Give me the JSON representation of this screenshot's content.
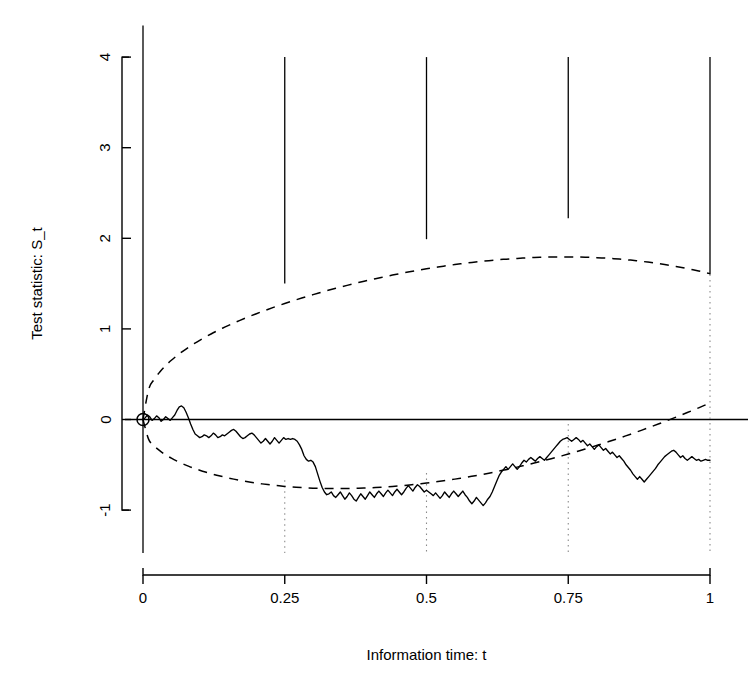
{
  "figure": {
    "background_color": "#ffffff",
    "ink_color": "#000000"
  },
  "chart_data": {
    "type": "line",
    "title": "",
    "subtitle": "",
    "xlabel": "Information time: t",
    "ylabel": "Test statistic: S_t",
    "xlim": [
      0,
      1
    ],
    "ylim": [
      -1.35,
      4.35
    ],
    "grid": false,
    "legend": null,
    "x_ticks": [
      0,
      0.25,
      0.5,
      0.75,
      1
    ],
    "x_tick_labels": [
      "0",
      "0.25",
      "0.5",
      "0.75",
      "1"
    ],
    "y_ticks": [
      -1,
      0,
      1,
      2,
      3,
      4
    ],
    "y_tick_labels": [
      "-1",
      "0",
      "1",
      "2",
      "3",
      "4"
    ],
    "series": [
      {
        "name": "Test statistic sample path",
        "style": "solid",
        "marker_at_origin": "open-circle",
        "x": [
          0,
          0.004,
          0.008,
          0.012,
          0.016,
          0.02,
          0.024,
          0.028,
          0.032,
          0.036,
          0.04,
          0.044,
          0.048,
          0.052,
          0.056,
          0.06,
          0.064,
          0.068,
          0.072,
          0.076,
          0.08,
          0.084,
          0.088,
          0.092,
          0.096,
          0.1,
          0.104,
          0.108,
          0.112,
          0.116,
          0.12,
          0.124,
          0.128,
          0.132,
          0.136,
          0.14,
          0.144,
          0.148,
          0.152,
          0.156,
          0.16,
          0.164,
          0.168,
          0.172,
          0.176,
          0.18,
          0.184,
          0.188,
          0.192,
          0.196,
          0.2,
          0.204,
          0.208,
          0.212,
          0.216,
          0.22,
          0.224,
          0.228,
          0.232,
          0.236,
          0.24,
          0.244,
          0.248,
          0.252,
          0.256,
          0.26,
          0.264,
          0.268,
          0.272,
          0.276,
          0.28,
          0.284,
          0.288,
          0.292,
          0.296,
          0.3,
          0.304,
          0.308,
          0.312,
          0.316,
          0.32,
          0.324,
          0.328,
          0.332,
          0.336,
          0.34,
          0.344,
          0.348,
          0.352,
          0.356,
          0.36,
          0.364,
          0.368,
          0.372,
          0.376,
          0.38,
          0.384,
          0.388,
          0.392,
          0.396,
          0.4,
          0.404,
          0.408,
          0.412,
          0.416,
          0.42,
          0.424,
          0.428,
          0.432,
          0.436,
          0.44,
          0.444,
          0.448,
          0.452,
          0.456,
          0.46,
          0.464,
          0.468,
          0.472,
          0.476,
          0.48,
          0.484,
          0.488,
          0.492,
          0.496,
          0.5,
          0.504,
          0.508,
          0.512,
          0.516,
          0.52,
          0.524,
          0.528,
          0.532,
          0.536,
          0.54,
          0.544,
          0.548,
          0.552,
          0.556,
          0.56,
          0.564,
          0.568,
          0.572,
          0.576,
          0.58,
          0.584,
          0.588,
          0.592,
          0.596,
          0.6,
          0.604,
          0.608,
          0.612,
          0.616,
          0.62,
          0.624,
          0.628,
          0.632,
          0.636,
          0.64,
          0.644,
          0.648,
          0.652,
          0.656,
          0.66,
          0.664,
          0.668,
          0.672,
          0.676,
          0.68,
          0.684,
          0.688,
          0.692,
          0.696,
          0.7,
          0.704,
          0.708,
          0.712,
          0.716,
          0.72,
          0.724,
          0.728,
          0.732,
          0.736,
          0.74,
          0.744,
          0.748,
          0.752,
          0.756,
          0.76,
          0.764,
          0.768,
          0.772,
          0.776,
          0.78,
          0.784,
          0.788,
          0.792,
          0.796,
          0.8,
          0.804,
          0.808,
          0.812,
          0.816,
          0.82,
          0.824,
          0.828,
          0.832,
          0.836,
          0.84,
          0.844,
          0.848,
          0.852,
          0.856,
          0.86,
          0.864,
          0.868,
          0.872,
          0.876,
          0.88,
          0.884,
          0.888,
          0.892,
          0.896,
          0.9,
          0.904,
          0.908,
          0.912,
          0.916,
          0.92,
          0.924,
          0.928,
          0.932,
          0.936,
          0.94,
          0.944,
          0.948,
          0.952,
          0.956,
          0.96,
          0.964,
          0.968,
          0.972,
          0.976,
          0.98,
          0.984,
          0.988,
          0.992,
          0.996,
          1
        ],
        "y": [
          0,
          0.02,
          0.05,
          0.03,
          -0.01,
          0.01,
          0.04,
          0.02,
          -0.02,
          0.0,
          0.03,
          0.01,
          -0.01,
          0.02,
          0.05,
          0.1,
          0.14,
          0.15,
          0.13,
          0.08,
          0.02,
          -0.05,
          -0.11,
          -0.16,
          -0.18,
          -0.2,
          -0.19,
          -0.17,
          -0.18,
          -0.2,
          -0.18,
          -0.15,
          -0.17,
          -0.2,
          -0.19,
          -0.17,
          -0.18,
          -0.16,
          -0.14,
          -0.12,
          -0.11,
          -0.13,
          -0.16,
          -0.19,
          -0.21,
          -0.2,
          -0.18,
          -0.16,
          -0.15,
          -0.17,
          -0.2,
          -0.23,
          -0.26,
          -0.24,
          -0.21,
          -0.24,
          -0.27,
          -0.24,
          -0.2,
          -0.23,
          -0.26,
          -0.23,
          -0.2,
          -0.22,
          -0.21,
          -0.22,
          -0.21,
          -0.22,
          -0.24,
          -0.28,
          -0.33,
          -0.4,
          -0.44,
          -0.46,
          -0.45,
          -0.47,
          -0.52,
          -0.6,
          -0.68,
          -0.75,
          -0.8,
          -0.83,
          -0.82,
          -0.8,
          -0.84,
          -0.86,
          -0.83,
          -0.8,
          -0.84,
          -0.88,
          -0.85,
          -0.81,
          -0.84,
          -0.88,
          -0.9,
          -0.86,
          -0.82,
          -0.85,
          -0.88,
          -0.84,
          -0.8,
          -0.83,
          -0.86,
          -0.82,
          -0.79,
          -0.82,
          -0.85,
          -0.81,
          -0.78,
          -0.81,
          -0.84,
          -0.8,
          -0.77,
          -0.8,
          -0.83,
          -0.8,
          -0.76,
          -0.73,
          -0.76,
          -0.79,
          -0.75,
          -0.72,
          -0.74,
          -0.77,
          -0.8,
          -0.78,
          -0.8,
          -0.82,
          -0.84,
          -0.81,
          -0.84,
          -0.87,
          -0.84,
          -0.8,
          -0.83,
          -0.86,
          -0.82,
          -0.79,
          -0.82,
          -0.85,
          -0.82,
          -0.79,
          -0.83,
          -0.86,
          -0.9,
          -0.93,
          -0.9,
          -0.86,
          -0.89,
          -0.92,
          -0.95,
          -0.92,
          -0.88,
          -0.85,
          -0.8,
          -0.74,
          -0.68,
          -0.62,
          -0.58,
          -0.55,
          -0.52,
          -0.55,
          -0.52,
          -0.49,
          -0.52,
          -0.55,
          -0.52,
          -0.48,
          -0.45,
          -0.47,
          -0.44,
          -0.42,
          -0.44,
          -0.46,
          -0.43,
          -0.41,
          -0.43,
          -0.45,
          -0.42,
          -0.39,
          -0.36,
          -0.33,
          -0.3,
          -0.27,
          -0.24,
          -0.22,
          -0.21,
          -0.2,
          -0.22,
          -0.24,
          -0.22,
          -0.2,
          -0.22,
          -0.25,
          -0.23,
          -0.26,
          -0.29,
          -0.27,
          -0.3,
          -0.33,
          -0.3,
          -0.28,
          -0.31,
          -0.34,
          -0.32,
          -0.35,
          -0.38,
          -0.36,
          -0.39,
          -0.42,
          -0.4,
          -0.43,
          -0.46,
          -0.5,
          -0.53,
          -0.56,
          -0.6,
          -0.63,
          -0.66,
          -0.63,
          -0.66,
          -0.69,
          -0.66,
          -0.63,
          -0.6,
          -0.57,
          -0.54,
          -0.5,
          -0.47,
          -0.44,
          -0.41,
          -0.39,
          -0.37,
          -0.35,
          -0.34,
          -0.36,
          -0.39,
          -0.42,
          -0.4,
          -0.43,
          -0.45,
          -0.43,
          -0.41,
          -0.43,
          -0.45,
          -0.44,
          -0.46,
          -0.45,
          -0.44,
          -0.45,
          -0.45
        ]
      }
    ],
    "boundaries": {
      "style": "dashed",
      "shape": "ellipse",
      "description": "Continuous dashed confidence/stopping boundary forming an ellipse from (0,0) to (1, ~1.6)",
      "upper": {
        "t": [
          0,
          0.05,
          0.1,
          0.15,
          0.2,
          0.25,
          0.3,
          0.35,
          0.4,
          0.45,
          0.5,
          0.55,
          0.6,
          0.65,
          0.7,
          0.75,
          0.8,
          0.85,
          0.9,
          0.95,
          1
        ],
        "value": [
          0.0,
          0.38,
          0.62,
          0.84,
          1.03,
          1.5,
          1.37,
          1.52,
          1.66,
          1.79,
          1.99,
          2.0,
          2.08,
          2.15,
          2.2,
          2.22,
          2.23,
          2.2,
          2.1,
          1.94,
          1.6
        ]
      },
      "lower": {
        "t": [
          0,
          0.05,
          0.1,
          0.15,
          0.2,
          0.25,
          0.3,
          0.35,
          0.4,
          0.45,
          0.5,
          0.55,
          0.6,
          0.65,
          0.7,
          0.75,
          0.8,
          0.85,
          0.9,
          0.95,
          1
        ],
        "value": [
          0.0,
          -0.32,
          -0.48,
          -0.58,
          -0.64,
          -0.67,
          -0.68,
          -0.68,
          -0.66,
          -0.63,
          -0.59,
          -0.53,
          -0.45,
          -0.35,
          -0.22,
          -0.05,
          0.18,
          0.48,
          0.86,
          1.25,
          1.6
        ]
      }
    },
    "interim_analyses": {
      "label": "Interim analysis boundary markers",
      "t": [
        0.25,
        0.5,
        0.75,
        1
      ],
      "upper_boundary_value": [
        1.5,
        1.99,
        2.22,
        1.6
      ],
      "vertical_line_top": 4,
      "dotted_guide_bottom": -1.35
    },
    "annotations": [
      {
        "name": "origin-marker",
        "t": 0,
        "value": 0,
        "shape": "open-circle"
      }
    ]
  }
}
